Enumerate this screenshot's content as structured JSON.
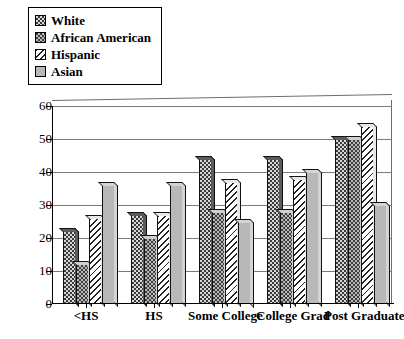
{
  "chart_data": {
    "type": "bar",
    "title": "",
    "xlabel": "",
    "ylabel": "",
    "ylim": [
      0,
      60
    ],
    "ytick_step": 10,
    "grid": true,
    "legend_position": "top-left",
    "categories": [
      "<HS",
      "HS",
      "Some College",
      "College Grad",
      "Post Graduate"
    ],
    "series": [
      {
        "name": "White",
        "pattern": "dark-dotted",
        "values": [
          22,
          27,
          44,
          44,
          50
        ]
      },
      {
        "name": "African American",
        "pattern": "light-dotted",
        "values": [
          12,
          20,
          28,
          28,
          50
        ]
      },
      {
        "name": "Hispanic",
        "pattern": "diagonal-hatch",
        "values": [
          26,
          27,
          37,
          38,
          54
        ]
      },
      {
        "name": "Asian",
        "pattern": "solid-gray",
        "values": [
          36,
          36,
          25,
          40,
          30
        ]
      }
    ],
    "ytick_labels": [
      "0",
      "10",
      "20",
      "30",
      "40",
      "50",
      "60"
    ]
  },
  "legend": {
    "items": [
      {
        "label": "White"
      },
      {
        "label": "African American"
      },
      {
        "label": "Hispanic"
      },
      {
        "label": "Asian"
      }
    ]
  }
}
